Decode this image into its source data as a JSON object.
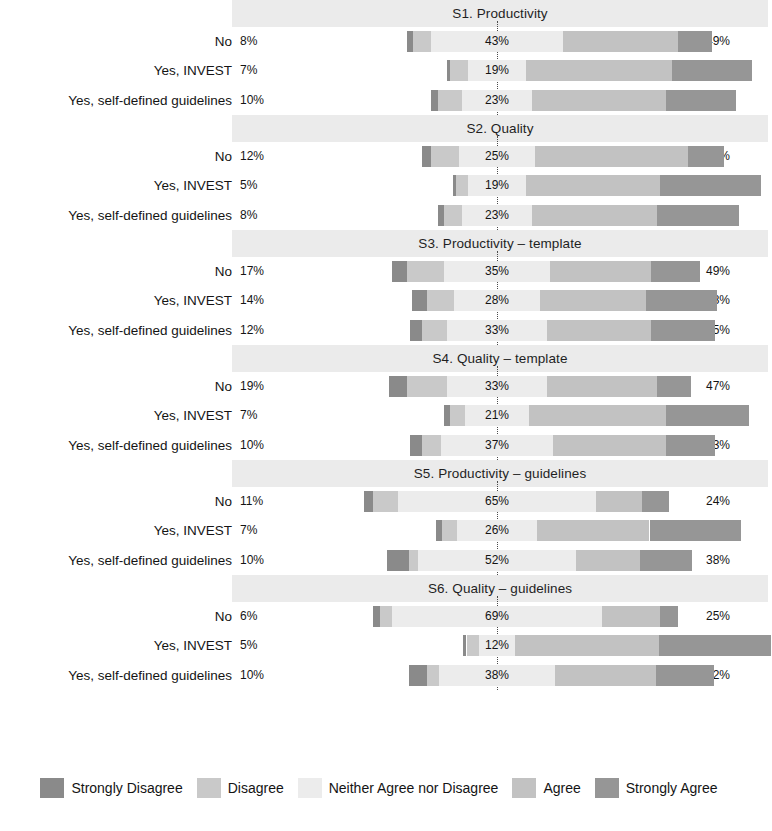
{
  "chart_data": {
    "type": "bar",
    "subtype": "diverging-stacked-likert",
    "title": "",
    "xlabel": "",
    "ylabel": "",
    "grid": false,
    "legend_position": "bottom",
    "zero_line": "dotted vertical reference at center of Neither Agree nor Disagree",
    "categories": [
      "Strongly Disagree",
      "Disagree",
      "Neither Agree nor Disagree",
      "Agree",
      "Strongly Agree"
    ],
    "category_colors": [
      "#8a8a8a",
      "#c9c9c9",
      "#ececec",
      "#c2c2c2",
      "#969696"
    ],
    "groups": [
      "No",
      "Yes, INVEST",
      "Yes, self-defined guidelines"
    ],
    "panels": [
      {
        "title": "S1. Productivity",
        "rows": [
          {
            "group": "No",
            "left_total": "8%",
            "right_total": "49%",
            "bar_label": "43%",
            "values": {
              "strongly_disagree": 2,
              "disagree": 6,
              "neither": 43,
              "agree": 38,
              "strongly_agree": 11
            }
          },
          {
            "group": "Yes, INVEST",
            "left_total": "7%",
            "right_total": "74%",
            "bar_label": "19%",
            "values": {
              "strongly_disagree": 1,
              "disagree": 6,
              "neither": 19,
              "agree": 48,
              "strongly_agree": 26
            }
          },
          {
            "group": "Yes, self-defined guidelines",
            "left_total": "10%",
            "right_total": "67%",
            "bar_label": "23%",
            "values": {
              "strongly_disagree": 2,
              "disagree": 8,
              "neither": 23,
              "agree": 44,
              "strongly_agree": 23
            }
          }
        ]
      },
      {
        "title": "S2. Quality",
        "rows": [
          {
            "group": "No",
            "left_total": "12%",
            "right_total": "62%",
            "bar_label": "25%",
            "values": {
              "strongly_disagree": 3,
              "disagree": 9,
              "neither": 25,
              "agree": 50,
              "strongly_agree": 12
            }
          },
          {
            "group": "Yes, INVEST",
            "left_total": "5%",
            "right_total": "77%",
            "bar_label": "19%",
            "values": {
              "strongly_disagree": 1,
              "disagree": 4,
              "neither": 19,
              "agree": 44,
              "strongly_agree": 33
            }
          },
          {
            "group": "Yes, self-defined guidelines",
            "left_total": "8%",
            "right_total": "68%",
            "bar_label": "23%",
            "values": {
              "strongly_disagree": 2,
              "disagree": 6,
              "neither": 23,
              "agree": 41,
              "strongly_agree": 27
            }
          }
        ]
      },
      {
        "title": "S3. Productivity – template",
        "rows": [
          {
            "group": "No",
            "left_total": "17%",
            "right_total": "49%",
            "bar_label": "35%",
            "values": {
              "strongly_disagree": 5,
              "disagree": 12,
              "neither": 35,
              "agree": 33,
              "strongly_agree": 16
            }
          },
          {
            "group": "Yes, INVEST",
            "left_total": "14%",
            "right_total": "58%",
            "bar_label": "28%",
            "values": {
              "strongly_disagree": 5,
              "disagree": 9,
              "neither": 28,
              "agree": 35,
              "strongly_agree": 23
            }
          },
          {
            "group": "Yes, self-defined guidelines",
            "left_total": "12%",
            "right_total": "55%",
            "bar_label": "33%",
            "values": {
              "strongly_disagree": 4,
              "disagree": 8,
              "neither": 33,
              "agree": 34,
              "strongly_agree": 21
            }
          }
        ]
      },
      {
        "title": "S4. Quality – template",
        "rows": [
          {
            "group": "No",
            "left_total": "19%",
            "right_total": "47%",
            "bar_label": "33%",
            "values": {
              "strongly_disagree": 6,
              "disagree": 13,
              "neither": 33,
              "agree": 36,
              "strongly_agree": 11
            }
          },
          {
            "group": "Yes, INVEST",
            "left_total": "7%",
            "right_total": "72%",
            "bar_label": "21%",
            "values": {
              "strongly_disagree": 2,
              "disagree": 5,
              "neither": 21,
              "agree": 45,
              "strongly_agree": 27
            }
          },
          {
            "group": "Yes, self-defined guidelines",
            "left_total": "10%",
            "right_total": "53%",
            "bar_label": "37%",
            "values": {
              "strongly_disagree": 4,
              "disagree": 6,
              "neither": 37,
              "agree": 37,
              "strongly_agree": 16
            }
          }
        ]
      },
      {
        "title": "S5. Productivity – guidelines",
        "rows": [
          {
            "group": "No",
            "left_total": "11%",
            "right_total": "24%",
            "bar_label": "65%",
            "values": {
              "strongly_disagree": 3,
              "disagree": 8,
              "neither": 65,
              "agree": 15,
              "strongly_agree": 9
            }
          },
          {
            "group": "Yes, INVEST",
            "left_total": "7%",
            "right_total": "67%",
            "bar_label": "26%",
            "values": {
              "strongly_disagree": 2,
              "disagree": 5,
              "neither": 26,
              "agree": 37,
              "strongly_agree": 30
            }
          },
          {
            "group": "Yes, self-defined guidelines",
            "left_total": "10%",
            "right_total": "38%",
            "bar_label": "52%",
            "values": {
              "strongly_disagree": 7,
              "disagree": 3,
              "neither": 52,
              "agree": 21,
              "strongly_agree": 17
            }
          }
        ]
      },
      {
        "title": "S6. Quality – guidelines",
        "rows": [
          {
            "group": "No",
            "left_total": "6%",
            "right_total": "25%",
            "bar_label": "69%",
            "values": {
              "strongly_disagree": 2,
              "disagree": 4,
              "neither": 69,
              "agree": 19,
              "strongly_agree": 6
            }
          },
          {
            "group": "Yes, INVEST",
            "left_total": "5%",
            "right_total": "84%",
            "bar_label": "12%",
            "values": {
              "strongly_disagree": 1,
              "disagree": 4,
              "neither": 12,
              "agree": 47,
              "strongly_agree": 37
            }
          },
          {
            "group": "Yes, self-defined guidelines",
            "left_total": "10%",
            "right_total": "52%",
            "bar_label": "38%",
            "values": {
              "strongly_disagree": 6,
              "disagree": 4,
              "neither": 38,
              "agree": 33,
              "strongly_agree": 19
            }
          }
        ]
      }
    ]
  },
  "legend": {
    "items": [
      {
        "label": "Strongly Disagree",
        "color": "#8a8a8a"
      },
      {
        "label": "Disagree",
        "color": "#c9c9c9"
      },
      {
        "label": "Neither Agree nor Disagree",
        "color": "#ececec"
      },
      {
        "label": "Agree",
        "color": "#c2c2c2"
      },
      {
        "label": "Strongly Agree",
        "color": "#969696"
      }
    ]
  },
  "style": {
    "panel_strip_color": "#ebebeb",
    "background": "#ffffff",
    "text_color": "#141414",
    "zero_line_color": "#4a4a4a"
  }
}
